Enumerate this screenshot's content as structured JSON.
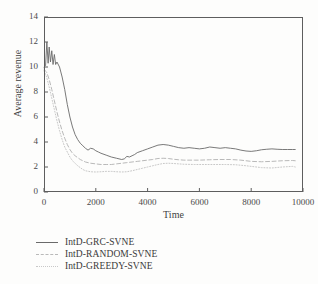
{
  "chart_data": {
    "type": "line",
    "title": "",
    "xlabel": "Time",
    "ylabel": "Average revenue",
    "xlim": [
      0,
      10000
    ],
    "ylim": [
      0,
      14
    ],
    "xticks": [
      "0",
      "2000",
      "4000",
      "6000",
      "8000",
      "10000"
    ],
    "xtick_values": [
      0,
      2000,
      4000,
      6000,
      8000,
      10000
    ],
    "yticks": [
      "0",
      "2",
      "4",
      "6",
      "8",
      "10",
      "12",
      "14"
    ],
    "ytick_values": [
      0,
      2,
      4,
      6,
      8,
      10,
      12,
      14
    ],
    "grid": false,
    "legend_position": "below-left",
    "series": [
      {
        "name": "IntD-GRC-SVNE",
        "style": "solid",
        "color": "#6a6a6a",
        "x": [
          0,
          60,
          110,
          160,
          200,
          250,
          300,
          350,
          400,
          450,
          500,
          600,
          700,
          800,
          900,
          1000,
          1100,
          1200,
          1300,
          1400,
          1500,
          1600,
          1700,
          1800,
          1900,
          2000,
          2100,
          2200,
          2400,
          2600,
          2800,
          3000,
          3100,
          3200,
          3300,
          3400,
          3500,
          3600,
          3800,
          4000,
          4200,
          4400,
          4600,
          4800,
          5000,
          5200,
          5400,
          5600,
          5800,
          6000,
          6200,
          6400,
          6600,
          6800,
          7000,
          7200,
          7400,
          7600,
          7800,
          8000,
          8200,
          8400,
          8600,
          8800,
          9000,
          9200,
          9400,
          9600,
          9700
        ],
        "y": [
          10.0,
          10.1,
          12.0,
          10.3,
          11.6,
          10.4,
          11.3,
          10.2,
          11.0,
          10.2,
          10.4,
          10.0,
          9.2,
          8.2,
          7.0,
          6.0,
          5.2,
          4.6,
          4.2,
          3.9,
          3.7,
          3.5,
          3.35,
          3.5,
          3.45,
          3.3,
          3.2,
          3.1,
          2.95,
          2.8,
          2.7,
          2.6,
          2.65,
          2.85,
          2.8,
          2.9,
          3.0,
          3.15,
          3.3,
          3.45,
          3.6,
          3.75,
          3.8,
          3.75,
          3.65,
          3.55,
          3.5,
          3.55,
          3.5,
          3.45,
          3.5,
          3.6,
          3.55,
          3.5,
          3.55,
          3.5,
          3.45,
          3.35,
          3.28,
          3.25,
          3.3,
          3.38,
          3.42,
          3.45,
          3.42,
          3.4,
          3.4,
          3.4,
          3.4
        ]
      },
      {
        "name": "IntD-RANDOM-SVNE",
        "style": "dashed",
        "color": "#b9b9b9",
        "x": [
          0,
          100,
          200,
          300,
          400,
          500,
          600,
          700,
          800,
          900,
          1000,
          1100,
          1200,
          1300,
          1400,
          1500,
          1600,
          1800,
          2000,
          2200,
          2400,
          2600,
          2800,
          3000,
          3200,
          3400,
          3600,
          3800,
          4000,
          4200,
          4400,
          4600,
          4800,
          5000,
          5200,
          5400,
          5600,
          5800,
          6000,
          6400,
          6800,
          7200,
          7600,
          8000,
          8400,
          8800,
          9200,
          9600,
          9700
        ],
        "y": [
          9.8,
          9.6,
          9.0,
          8.2,
          7.3,
          6.4,
          5.6,
          4.9,
          4.3,
          3.8,
          3.4,
          3.1,
          2.9,
          2.75,
          2.6,
          2.5,
          2.4,
          2.3,
          2.25,
          2.2,
          2.2,
          2.2,
          2.25,
          2.3,
          2.35,
          2.4,
          2.45,
          2.5,
          2.55,
          2.6,
          2.68,
          2.7,
          2.68,
          2.62,
          2.58,
          2.55,
          2.55,
          2.55,
          2.55,
          2.58,
          2.6,
          2.6,
          2.55,
          2.45,
          2.42,
          2.45,
          2.5,
          2.52,
          2.5
        ]
      },
      {
        "name": "IntD-GREEDY-SVNE",
        "style": "dotted",
        "color": "#c8c8c8",
        "x": [
          0,
          100,
          200,
          300,
          400,
          500,
          600,
          700,
          800,
          900,
          1000,
          1100,
          1200,
          1300,
          1400,
          1500,
          1600,
          1800,
          2000,
          2200,
          2400,
          2600,
          2800,
          3000,
          3200,
          3400,
          3600,
          3800,
          4000,
          4200,
          4400,
          4600,
          4800,
          5000,
          5400,
          5800,
          6200,
          6600,
          7000,
          7400,
          7800,
          8000,
          8400,
          8800,
          9200,
          9600,
          9700
        ],
        "y": [
          9.7,
          9.2,
          8.4,
          7.5,
          6.6,
          5.7,
          4.9,
          4.2,
          3.6,
          3.2,
          2.8,
          2.5,
          2.3,
          2.1,
          1.95,
          1.8,
          1.7,
          1.62,
          1.6,
          1.62,
          1.65,
          1.65,
          1.62,
          1.6,
          1.62,
          1.7,
          1.8,
          1.9,
          2.0,
          2.1,
          2.2,
          2.28,
          2.3,
          2.28,
          2.22,
          2.2,
          2.2,
          2.2,
          2.2,
          2.18,
          2.1,
          2.05,
          1.95,
          1.92,
          2.0,
          2.05,
          2.0
        ]
      }
    ]
  },
  "legend": {
    "items": [
      {
        "label": "IntD-GRC-SVNE"
      },
      {
        "label": "IntD-RANDOM-SVNE"
      },
      {
        "label": "IntD-GREEDY-SVNE"
      }
    ]
  }
}
